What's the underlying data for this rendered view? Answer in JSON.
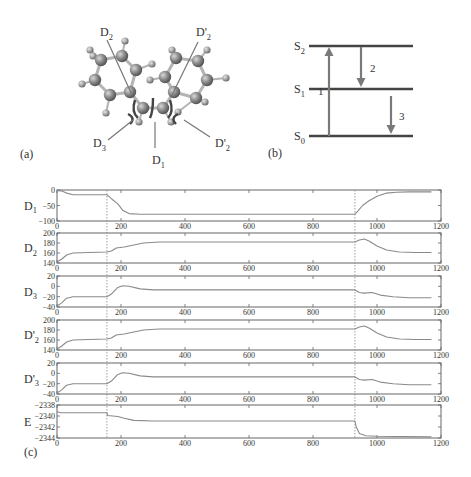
{
  "panels": {
    "a": {
      "label": "(a)",
      "annotations": [
        {
          "text": "D",
          "sub": "2",
          "prime": false,
          "x": 100,
          "y": 36,
          "line": [
            107,
            40,
            132,
            95
          ]
        },
        {
          "text": "D",
          "sub": "2",
          "prime": true,
          "x": 196,
          "y": 36,
          "line": [
            198,
            42,
            172,
            95
          ]
        },
        {
          "text": "D",
          "sub": "3",
          "prime": false,
          "x": 93,
          "y": 147,
          "line": [
            108,
            140,
            133,
            120
          ]
        },
        {
          "text": "D",
          "sub": "1",
          "prime": false,
          "x": 152,
          "y": 164,
          "line": [
            155,
            148,
            155,
            122
          ]
        },
        {
          "text": "D",
          "sub": "2",
          "prime": true,
          "x": 215,
          "y": 147,
          "line": [
            210,
            137,
            184,
            120
          ]
        }
      ]
    },
    "b": {
      "label": "(b)",
      "levels": [
        {
          "name": "S",
          "sub": "2",
          "y": 46
        },
        {
          "name": "S",
          "sub": "1",
          "y": 89
        },
        {
          "name": "S",
          "sub": "0",
          "y": 136
        }
      ],
      "transitions": [
        {
          "label": "1",
          "from": "S0",
          "to": "S2",
          "direction": "up"
        },
        {
          "label": "2",
          "from": "S2",
          "to": "S1",
          "direction": "down"
        },
        {
          "label": "3",
          "from": "S1",
          "to": "S0",
          "direction": "down"
        }
      ]
    },
    "c": {
      "label": "(c)"
    }
  },
  "chart_data": {
    "type": "line",
    "title": "",
    "xlabel": "",
    "x_range": [
      0,
      1200
    ],
    "x_ticks": [
      0,
      200,
      400,
      600,
      800,
      1000,
      1200
    ],
    "vertical_markers": [
      156,
      931
    ],
    "grid": false,
    "subplots": [
      {
        "ylabel": "D",
        "ylabel_sub": "1",
        "ylabel_prime": false,
        "ylim": [
          -100,
          0
        ],
        "y_ticks": [
          0,
          -50,
          -100
        ],
        "points": [
          [
            0,
            -2
          ],
          [
            15,
            -3
          ],
          [
            30,
            -10
          ],
          [
            50,
            -15
          ],
          [
            100,
            -15
          ],
          [
            156,
            -15
          ],
          [
            170,
            -28
          ],
          [
            190,
            -45
          ],
          [
            205,
            -65
          ],
          [
            225,
            -76
          ],
          [
            260,
            -78
          ],
          [
            500,
            -78
          ],
          [
            931,
            -78
          ],
          [
            940,
            -68
          ],
          [
            955,
            -50
          ],
          [
            975,
            -35
          ],
          [
            1000,
            -20
          ],
          [
            1030,
            -10
          ],
          [
            1060,
            -7
          ],
          [
            1100,
            -6
          ],
          [
            1170,
            -6
          ]
        ]
      },
      {
        "ylabel": "D",
        "ylabel_sub": "2",
        "ylabel_prime": false,
        "ylim": [
          140,
          200
        ],
        "y_ticks": [
          200,
          180,
          160,
          140
        ],
        "points": [
          [
            0,
            142
          ],
          [
            15,
            148
          ],
          [
            30,
            156
          ],
          [
            50,
            160
          ],
          [
            100,
            161
          ],
          [
            156,
            162
          ],
          [
            170,
            164
          ],
          [
            185,
            170
          ],
          [
            210,
            172
          ],
          [
            240,
            176
          ],
          [
            270,
            180
          ],
          [
            320,
            182
          ],
          [
            500,
            182
          ],
          [
            931,
            182
          ],
          [
            945,
            186
          ],
          [
            960,
            188
          ],
          [
            975,
            184
          ],
          [
            1000,
            174
          ],
          [
            1030,
            166
          ],
          [
            1070,
            162
          ],
          [
            1120,
            161
          ],
          [
            1170,
            161
          ]
        ]
      },
      {
        "ylabel": "D",
        "ylabel_sub": "3",
        "ylabel_prime": false,
        "ylim": [
          -40,
          20
        ],
        "y_ticks": [
          20,
          0,
          -20,
          -40
        ],
        "points": [
          [
            0,
            -38
          ],
          [
            15,
            -32
          ],
          [
            30,
            -23
          ],
          [
            50,
            -20
          ],
          [
            100,
            -20
          ],
          [
            156,
            -20
          ],
          [
            170,
            -15
          ],
          [
            190,
            -2
          ],
          [
            205,
            1
          ],
          [
            225,
            0
          ],
          [
            260,
            -5
          ],
          [
            300,
            -7
          ],
          [
            500,
            -7
          ],
          [
            931,
            -7
          ],
          [
            945,
            -12
          ],
          [
            960,
            -13
          ],
          [
            985,
            -12
          ],
          [
            1010,
            -17
          ],
          [
            1050,
            -20
          ],
          [
            1100,
            -22
          ],
          [
            1170,
            -22
          ]
        ]
      },
      {
        "ylabel": "D'",
        "ylabel_sub": "2",
        "ylabel_prime": true,
        "ylim": [
          140,
          200
        ],
        "y_ticks": [
          200,
          180,
          160,
          140
        ],
        "points": [
          [
            0,
            142
          ],
          [
            15,
            148
          ],
          [
            30,
            156
          ],
          [
            50,
            160
          ],
          [
            100,
            161
          ],
          [
            156,
            162
          ],
          [
            170,
            164
          ],
          [
            185,
            170
          ],
          [
            210,
            172
          ],
          [
            240,
            176
          ],
          [
            270,
            180
          ],
          [
            320,
            182
          ],
          [
            500,
            182
          ],
          [
            931,
            182
          ],
          [
            945,
            186
          ],
          [
            960,
            188
          ],
          [
            975,
            184
          ],
          [
            1000,
            174
          ],
          [
            1030,
            166
          ],
          [
            1070,
            162
          ],
          [
            1120,
            161
          ],
          [
            1170,
            161
          ]
        ]
      },
      {
        "ylabel": "D'",
        "ylabel_sub": "3",
        "ylabel_prime": true,
        "ylim": [
          -40,
          20
        ],
        "y_ticks": [
          20,
          0,
          -20,
          -40
        ],
        "points": [
          [
            0,
            -38
          ],
          [
            15,
            -32
          ],
          [
            30,
            -23
          ],
          [
            50,
            -20
          ],
          [
            100,
            -20
          ],
          [
            156,
            -20
          ],
          [
            170,
            -15
          ],
          [
            190,
            -2
          ],
          [
            205,
            1
          ],
          [
            225,
            0
          ],
          [
            260,
            -5
          ],
          [
            300,
            -7
          ],
          [
            500,
            -7
          ],
          [
            931,
            -7
          ],
          [
            945,
            -12
          ],
          [
            960,
            -13
          ],
          [
            985,
            -12
          ],
          [
            1010,
            -17
          ],
          [
            1050,
            -20
          ],
          [
            1100,
            -22
          ],
          [
            1170,
            -22
          ]
        ]
      },
      {
        "ylabel": "E",
        "ylabel_sub": "",
        "ylabel_prime": false,
        "ylim": [
          -2344,
          -2338
        ],
        "y_ticks": [
          -2338,
          -2340,
          -2342,
          -2344
        ],
        "points": [
          [
            0,
            -2339.2
          ],
          [
            10,
            -2339.4
          ],
          [
            156,
            -2339.4
          ],
          [
            158,
            -2339.9
          ],
          [
            190,
            -2340.1
          ],
          [
            210,
            -2340.4
          ],
          [
            240,
            -2340.8
          ],
          [
            300,
            -2340.9
          ],
          [
            931,
            -2340.9
          ],
          [
            935,
            -2342.0
          ],
          [
            945,
            -2343.2
          ],
          [
            965,
            -2343.6
          ],
          [
            1000,
            -2343.7
          ],
          [
            1170,
            -2343.8
          ]
        ]
      }
    ]
  }
}
